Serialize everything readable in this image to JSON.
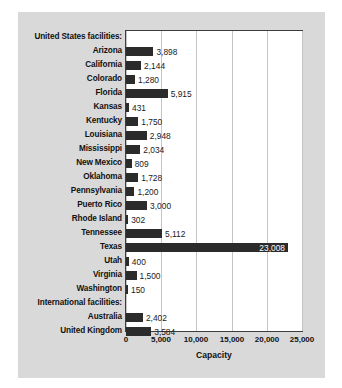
{
  "chart_data": {
    "type": "bar",
    "orientation": "horizontal",
    "title": "",
    "xlabel": "Capacity",
    "ylabel": "",
    "xlim": [
      0,
      25000
    ],
    "grid": true,
    "gridlines_x": [
      0,
      5000,
      10000,
      15000,
      20000,
      25000
    ],
    "legend": null,
    "tick_labels_x": [
      "0",
      "5,000",
      "10,000",
      "15,000",
      "20,000",
      "25,000"
    ],
    "tick_values_x": [
      0,
      5000,
      10000,
      15000,
      20000,
      25000
    ],
    "section_headers": [
      "United States facilities:",
      "International facilities:"
    ],
    "categories": [
      "United States facilities:",
      "Arizona",
      "California",
      "Colorado",
      "Florida",
      "Kansas",
      "Kentucky",
      "Louisiana",
      "Mississippi",
      "New Mexico",
      "Oklahoma",
      "Pennsylvania",
      "Puerto Rico",
      "Rhode Island",
      "Tennessee",
      "Texas",
      "Utah",
      "Virginia",
      "Washington",
      "International facilities:",
      "Australia",
      "United Kingdom"
    ],
    "values": [
      null,
      3898,
      2144,
      1280,
      5915,
      431,
      1750,
      2948,
      2034,
      809,
      1728,
      1200,
      3000,
      302,
      5112,
      23008,
      400,
      1500,
      150,
      null,
      2402,
      3584
    ],
    "value_labels": [
      null,
      "3,898",
      "2,144",
      "1,280",
      "5,915",
      "431",
      "1,750",
      "2,948",
      "2,034",
      "809",
      "1,728",
      "1,200",
      "3,000",
      "302",
      "5,112",
      "23,008",
      "400",
      "1,500",
      "150",
      null,
      "2,402",
      "3,584"
    ]
  },
  "colors": {
    "panel_background": "#d9d9d9",
    "plot_background": "#ffffff",
    "bar_fill": "#2b2b2b",
    "gridline": "#c4c4c4",
    "axis_border": "#3c3c3c",
    "text": "#111111",
    "inside_label_text": "#ffffff"
  }
}
